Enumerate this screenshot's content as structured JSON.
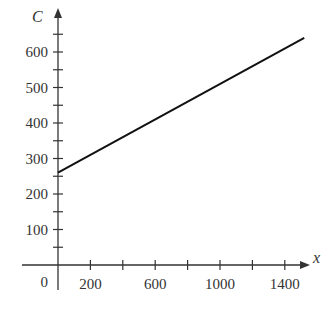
{
  "chart_data": {
    "type": "line",
    "title": "",
    "xlabel": "x",
    "ylabel": "C",
    "xlim": [
      0,
      1550
    ],
    "ylim": [
      0,
      680
    ],
    "x_ticks": [
      200,
      400,
      600,
      800,
      1000,
      1200,
      1400
    ],
    "x_tick_labels": [
      "200",
      "",
      "600",
      "",
      "1000",
      "",
      "1400"
    ],
    "y_ticks": [
      50,
      100,
      150,
      200,
      250,
      300,
      350,
      400,
      450,
      500,
      550,
      600,
      650
    ],
    "y_tick_labels": [
      "",
      "100",
      "",
      "200",
      "",
      "300",
      "",
      "400",
      "",
      "500",
      "",
      "600",
      ""
    ],
    "origin_label": "0",
    "grid": false,
    "legend": null,
    "series": [
      {
        "name": "C",
        "x": [
          0,
          1520
        ],
        "y": [
          260,
          640
        ]
      }
    ]
  }
}
